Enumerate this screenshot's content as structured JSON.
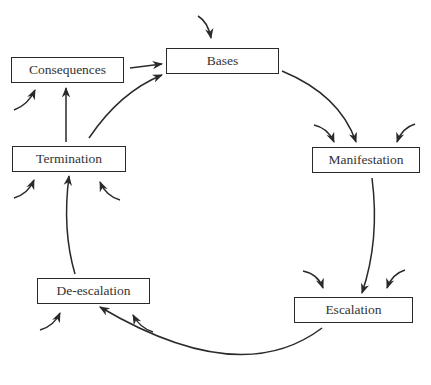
{
  "diagram": {
    "type": "cycle",
    "nodes": [
      {
        "id": "bases",
        "label": "Bases"
      },
      {
        "id": "manifestation",
        "label": "Manifestation"
      },
      {
        "id": "escalation",
        "label": "Escalation"
      },
      {
        "id": "de_escalation",
        "label": "De-escalation"
      },
      {
        "id": "termination",
        "label": "Termination"
      },
      {
        "id": "consequences",
        "label": "Consequences"
      }
    ],
    "edges": [
      {
        "from": "bases",
        "to": "manifestation"
      },
      {
        "from": "manifestation",
        "to": "escalation"
      },
      {
        "from": "escalation",
        "to": "de_escalation"
      },
      {
        "from": "de_escalation",
        "to": "termination"
      },
      {
        "from": "termination",
        "to": "bases"
      },
      {
        "from": "termination",
        "to": "consequences"
      },
      {
        "from": "consequences",
        "to": "bases"
      }
    ],
    "external_input_arrows": {
      "bases": 1,
      "manifestation": 2,
      "escalation": 2,
      "de_escalation": 2,
      "termination": 2,
      "consequences": 1
    },
    "colors": {
      "stroke": "#2a2a2a",
      "text": "#333333",
      "background": "#ffffff"
    }
  }
}
